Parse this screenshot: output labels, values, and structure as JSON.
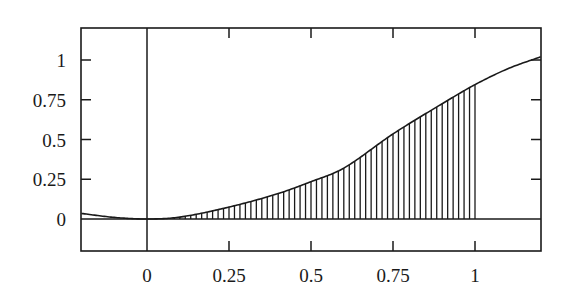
{
  "chart_data": {
    "type": "area",
    "title": "",
    "xlabel": "",
    "ylabel": "",
    "xlim": [
      -0.2,
      1.2
    ],
    "ylim": [
      -0.2,
      1.2
    ],
    "grid": false,
    "legend": null,
    "x_ticks": [
      0,
      0.25,
      0.5,
      0.75,
      1
    ],
    "x_tick_labels": [
      "0",
      "0.25",
      "0.5",
      "0.75",
      "1"
    ],
    "y_ticks": [
      0,
      0.25,
      0.5,
      0.75,
      1
    ],
    "y_tick_labels": [
      "0",
      "0.25",
      "0.5",
      "0.75",
      "1"
    ],
    "series": [
      {
        "name": "curve",
        "x": [
          -0.2,
          -0.1,
          0,
          0.1,
          0.25,
          0.4,
          0.5,
          0.6,
          0.75,
          0.9,
          1.0,
          1.1,
          1.2
        ],
        "values": [
          0.035,
          0.01,
          0,
          0.012,
          0.075,
          0.16,
          0.235,
          0.32,
          0.535,
          0.725,
          0.845,
          0.945,
          1.02
        ]
      }
    ],
    "shaded_region": {
      "from": 0,
      "to": 1,
      "style": "vertical-hatch",
      "hatch_count": 60
    },
    "annotations": [
      "Vertical axis line at x=0",
      "Horizontal axis line at y=0",
      "Area under curve from 0 to 1 shaded with vertical lines"
    ]
  },
  "colors": {
    "ink": "#1a1a1a",
    "background": "#ffffff"
  }
}
